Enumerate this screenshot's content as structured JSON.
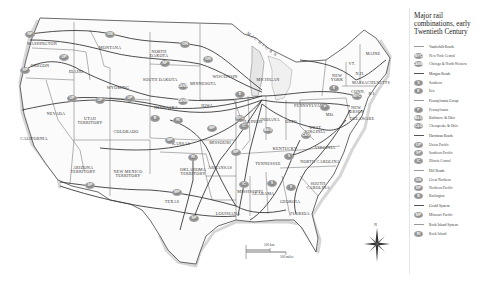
{
  "legend": {
    "title": "Major rail combinations, early Twentieth Century",
    "groups": [
      {
        "name": "Vanderbilt Roads",
        "items": [
          {
            "code": "NYC",
            "label": "New York Central"
          },
          {
            "code": "C&NW",
            "label": "Chicago & North Western"
          }
        ]
      },
      {
        "name": "Morgan Roads",
        "items": [
          {
            "code": "S",
            "label": "Southern"
          },
          {
            "code": "E",
            "label": "Erie"
          }
        ]
      },
      {
        "name": "Pennsylvania Group",
        "items": [
          {
            "code": "P",
            "label": "Pennsylvania"
          },
          {
            "code": "B&O",
            "label": "Baltimore & Ohio"
          },
          {
            "code": "C&O",
            "label": "Chesapeake & Ohio"
          }
        ]
      },
      {
        "name": "Harriman Roads",
        "items": [
          {
            "code": "UP",
            "label": "Union Pacific"
          },
          {
            "code": "SP",
            "label": "Southern Pacific"
          },
          {
            "code": "IC",
            "label": "Illinois Central"
          }
        ]
      },
      {
        "name": "Hill Roads",
        "items": [
          {
            "code": "GN",
            "label": "Great Northern"
          },
          {
            "code": "NP",
            "label": "Northern Pacific"
          },
          {
            "code": "B",
            "label": "Burlington"
          }
        ]
      },
      {
        "name": "Gould System",
        "items": [
          {
            "code": "MP",
            "label": "Missouri Pacific"
          }
        ]
      },
      {
        "name": "Rock Island System",
        "items": [
          {
            "code": "RI",
            "label": "Rock Island"
          }
        ]
      }
    ]
  },
  "map": {
    "state_labels": [
      {
        "name": "WASHINGTON",
        "x": 42,
        "y": 42
      },
      {
        "name": "OREGON",
        "x": 40,
        "y": 64
      },
      {
        "name": "IDAHO",
        "x": 76,
        "y": 70
      },
      {
        "name": "MONTANA",
        "x": 110,
        "y": 46
      },
      {
        "name": "WYOMING",
        "x": 118,
        "y": 86
      },
      {
        "name": "NORTH\nDAKOTA",
        "x": 159,
        "y": 50
      },
      {
        "name": "SOUTH DAKOTA",
        "x": 160,
        "y": 78
      },
      {
        "name": "NEBRASKA",
        "x": 166,
        "y": 106
      },
      {
        "name": "MINNESOTA",
        "x": 203,
        "y": 82
      },
      {
        "name": "WISCONSIN",
        "x": 225,
        "y": 75
      },
      {
        "name": "IOWA",
        "x": 207,
        "y": 104
      },
      {
        "name": "NEVADA",
        "x": 56,
        "y": 112
      },
      {
        "name": "UTAH\nTERRITORY",
        "x": 90,
        "y": 117
      },
      {
        "name": "COLORADO",
        "x": 126,
        "y": 130
      },
      {
        "name": "CALIFORNIA",
        "x": 34,
        "y": 137
      },
      {
        "name": "KANSAS",
        "x": 181,
        "y": 142
      },
      {
        "name": "MISSOURI",
        "x": 220,
        "y": 141
      },
      {
        "name": "ILLINOIS",
        "x": 253,
        "y": 120
      },
      {
        "name": "INDIANA",
        "x": 270,
        "y": 118
      },
      {
        "name": "OHIO",
        "x": 291,
        "y": 120
      },
      {
        "name": "MICHIGAN",
        "x": 268,
        "y": 78
      },
      {
        "name": "PENNSYLVANIA",
        "x": 311,
        "y": 104
      },
      {
        "name": "NEW\nYORK",
        "x": 337,
        "y": 74
      },
      {
        "name": "VT.",
        "x": 352,
        "y": 62
      },
      {
        "name": "N.H.",
        "x": 360,
        "y": 72
      },
      {
        "name": "MAINE",
        "x": 373,
        "y": 52
      },
      {
        "name": "MASSACHUSETTS",
        "x": 371,
        "y": 81
      },
      {
        "name": "CONN.",
        "x": 358,
        "y": 90
      },
      {
        "name": "R.I.",
        "x": 372,
        "y": 92
      },
      {
        "name": "NEW\nJERSEY",
        "x": 356,
        "y": 106
      },
      {
        "name": "DELAWARE",
        "x": 362,
        "y": 117
      },
      {
        "name": "MD.",
        "x": 330,
        "y": 113
      },
      {
        "name": "WEST\nVIRGINIA",
        "x": 315,
        "y": 126
      },
      {
        "name": "VIRGINIA",
        "x": 325,
        "y": 146
      },
      {
        "name": "KENTUCKY",
        "x": 285,
        "y": 147
      },
      {
        "name": "TENNESSEE",
        "x": 268,
        "y": 162
      },
      {
        "name": "NORTH CAROLINA",
        "x": 320,
        "y": 160
      },
      {
        "name": "SOUTH\nCAROLINA",
        "x": 318,
        "y": 182
      },
      {
        "name": "ARIZONA\nTERRITORY",
        "x": 83,
        "y": 166
      },
      {
        "name": "NEW MEXICO\nTERRITORY",
        "x": 128,
        "y": 170
      },
      {
        "name": "OKLAHOMA\nTERRITORY",
        "x": 193,
        "y": 168
      },
      {
        "name": "ARKANSAS",
        "x": 220,
        "y": 166
      },
      {
        "name": "TEXAS",
        "x": 172,
        "y": 200
      },
      {
        "name": "LOUISIANA",
        "x": 228,
        "y": 212
      },
      {
        "name": "MISSISSIPPI",
        "x": 250,
        "y": 190
      },
      {
        "name": "ALABAMA",
        "x": 263,
        "y": 192
      },
      {
        "name": "GEORGIA",
        "x": 290,
        "y": 200
      },
      {
        "name": "FLORIDA",
        "x": 300,
        "y": 212
      }
    ],
    "water_labels": [
      {
        "name": "MICHIGAN",
        "x": 243,
        "y": 42
      }
    ],
    "badges": [
      {
        "code": "NP",
        "x": 30,
        "y": 34
      },
      {
        "code": "GN",
        "x": 110,
        "y": 34
      },
      {
        "code": "SP",
        "x": 25,
        "y": 70
      },
      {
        "code": "UP",
        "x": 64,
        "y": 57
      },
      {
        "code": "GN",
        "x": 185,
        "y": 44
      },
      {
        "code": "NP",
        "x": 165,
        "y": 63
      },
      {
        "code": "GN",
        "x": 208,
        "y": 59
      },
      {
        "code": "C&NW",
        "x": 183,
        "y": 86
      },
      {
        "code": "C&NW",
        "x": 183,
        "y": 101
      },
      {
        "code": "E",
        "x": 240,
        "y": 94
      },
      {
        "code": "NYC",
        "x": 240,
        "y": 118
      },
      {
        "code": "UP",
        "x": 72,
        "y": 98
      },
      {
        "code": "UP",
        "x": 100,
        "y": 100
      },
      {
        "code": "UP",
        "x": 130,
        "y": 98
      },
      {
        "code": "B",
        "x": 155,
        "y": 118
      },
      {
        "code": "RI",
        "x": 178,
        "y": 120
      },
      {
        "code": "MP",
        "x": 212,
        "y": 128
      },
      {
        "code": "IC",
        "x": 244,
        "y": 126
      },
      {
        "code": "B&O",
        "x": 268,
        "y": 130
      },
      {
        "code": "MP",
        "x": 170,
        "y": 140
      },
      {
        "code": "RI",
        "x": 193,
        "y": 157
      },
      {
        "code": "MP",
        "x": 236,
        "y": 152
      },
      {
        "code": "SP",
        "x": 90,
        "y": 185
      },
      {
        "code": "MP",
        "x": 177,
        "y": 192
      },
      {
        "code": "SP",
        "x": 194,
        "y": 218
      },
      {
        "code": "IC",
        "x": 244,
        "y": 184
      },
      {
        "code": "S",
        "x": 272,
        "y": 183
      },
      {
        "code": "S",
        "x": 291,
        "y": 187
      },
      {
        "code": "S",
        "x": 289,
        "y": 156
      },
      {
        "code": "C&O",
        "x": 306,
        "y": 135
      },
      {
        "code": "P",
        "x": 325,
        "y": 107
      },
      {
        "code": "E",
        "x": 334,
        "y": 88
      },
      {
        "code": "NYC",
        "x": 357,
        "y": 96
      }
    ],
    "scale": {
      "km_label": "500 km",
      "mi_label": "500 miles",
      "zero": "0"
    },
    "compass": {
      "north_label": "N"
    }
  }
}
